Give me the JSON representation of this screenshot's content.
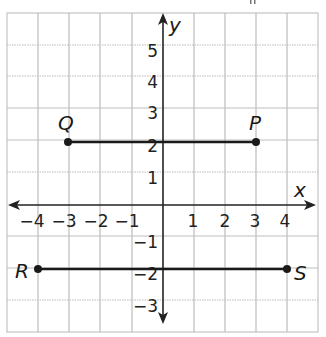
{
  "diagram": {
    "type": "coordinate-plane",
    "axes": {
      "x_label": "x",
      "y_label": "y",
      "x_ticks": [
        {
          "value": -4,
          "label": "−4"
        },
        {
          "value": -3,
          "label": "−3"
        },
        {
          "value": -2,
          "label": "−2"
        },
        {
          "value": -1,
          "label": "−1"
        },
        {
          "value": 1,
          "label": "1"
        },
        {
          "value": 2,
          "label": "2"
        },
        {
          "value": 3,
          "label": "3"
        },
        {
          "value": 4,
          "label": "4"
        }
      ],
      "y_ticks": [
        {
          "value": 5,
          "label": "5"
        },
        {
          "value": 4,
          "label": "4"
        },
        {
          "value": 3,
          "label": "3"
        },
        {
          "value": 2,
          "label": "2"
        },
        {
          "value": 1,
          "label": "1"
        },
        {
          "value": -1,
          "label": "−1"
        },
        {
          "value": -2,
          "label": "−2"
        },
        {
          "value": -3,
          "label": "−3"
        }
      ],
      "x_range": [
        -5,
        5
      ],
      "y_range": [
        -4,
        6
      ],
      "grid": true
    },
    "points": [
      {
        "name": "Q",
        "x": -3,
        "y": 2
      },
      {
        "name": "P",
        "x": 3,
        "y": 2
      },
      {
        "name": "R",
        "x": -4,
        "y": -2
      },
      {
        "name": "S",
        "x": 4,
        "y": -2
      }
    ],
    "segments": [
      {
        "from": "Q",
        "to": "P"
      },
      {
        "from": "R",
        "to": "S"
      }
    ],
    "colors": {
      "grid": "#b8b8b8",
      "axis": "#222222",
      "segment": "#1a1a1a",
      "point": "#1a1a1a"
    }
  }
}
